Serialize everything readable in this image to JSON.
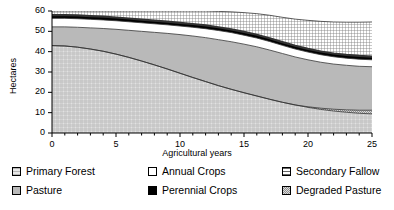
{
  "chart_data": {
    "type": "area",
    "title": "",
    "xlabel": "Agricultural years",
    "ylabel": "Hectares",
    "xlim": [
      0,
      25
    ],
    "ylim": [
      0,
      60
    ],
    "xticks": [
      0,
      5,
      10,
      15,
      20,
      25
    ],
    "yticks": [
      0,
      10,
      20,
      30,
      40,
      50,
      60
    ],
    "grid": false,
    "legend_position": "below",
    "stacked": true,
    "stack_order_bottom_to_top": [
      "Primary Forest",
      "Degraded Pasture",
      "Pasture",
      "Annual Crops",
      "Perennial Crops",
      "Secondary Fallow"
    ],
    "x": [
      0,
      1,
      2,
      3,
      4,
      5,
      6,
      7,
      8,
      9,
      10,
      11,
      12,
      13,
      14,
      15,
      16,
      17,
      18,
      19,
      20,
      21,
      22,
      23,
      24,
      25
    ],
    "series": [
      {
        "name": "Primary Forest",
        "swatch": "light-crosshatch",
        "color": "#d6d6d6",
        "values": [
          43.0,
          42.8,
          42.2,
          41.3,
          40.2,
          38.8,
          37.2,
          35.4,
          33.5,
          31.5,
          29.4,
          27.3,
          25.3,
          23.3,
          21.5,
          19.8,
          18.2,
          16.6,
          15.1,
          13.8,
          12.6,
          11.6,
          10.8,
          10.2,
          9.7,
          9.4
        ]
      },
      {
        "name": "Degraded Pasture",
        "swatch": "dense-dots",
        "color": "#bfbfbf",
        "values": [
          0.0,
          0.0,
          0.0,
          0.0,
          0.0,
          0.0,
          0.0,
          0.0,
          0.0,
          0.0,
          0.0,
          0.0,
          0.0,
          0.0,
          0.0,
          0.0,
          0.0,
          0.0,
          0.0,
          0.0,
          0.3,
          0.6,
          0.9,
          1.2,
          1.5,
          1.8
        ]
      },
      {
        "name": "Pasture",
        "swatch": "solid-gray",
        "color": "#b8b8b8",
        "values": [
          9.2,
          9.4,
          9.8,
          10.4,
          11.2,
          12.2,
          13.3,
          14.6,
          16.0,
          17.5,
          19.0,
          20.4,
          21.6,
          22.6,
          23.4,
          23.9,
          24.2,
          24.2,
          24.0,
          23.6,
          23.1,
          22.6,
          22.2,
          21.9,
          21.6,
          21.4
        ]
      },
      {
        "name": "Annual Crops",
        "swatch": "white",
        "color": "#ffffff",
        "values": [
          4.2,
          4.2,
          4.2,
          4.2,
          4.2,
          4.2,
          4.2,
          4.2,
          4.2,
          4.2,
          4.2,
          4.3,
          4.4,
          4.5,
          4.5,
          4.4,
          4.3,
          4.2,
          4.0,
          3.9,
          3.8,
          3.7,
          3.6,
          3.5,
          3.5,
          3.4
        ]
      },
      {
        "name": "Perennial Crops",
        "swatch": "solid-black",
        "color": "#000000",
        "values": [
          1.6,
          1.6,
          1.6,
          1.6,
          1.6,
          1.6,
          1.6,
          1.6,
          1.6,
          1.6,
          1.6,
          1.6,
          1.6,
          1.6,
          1.6,
          1.6,
          1.6,
          1.6,
          1.6,
          1.6,
          1.6,
          1.6,
          1.6,
          1.6,
          1.6,
          1.6
        ]
      },
      {
        "name": "Secondary Fallow",
        "swatch": "fine-crosshatch",
        "color": "#cccccc",
        "values": [
          2.0,
          2.0,
          2.2,
          2.5,
          2.8,
          3.2,
          3.7,
          4.2,
          4.7,
          5.2,
          5.8,
          6.4,
          7.1,
          7.8,
          8.6,
          9.5,
          10.4,
          11.3,
          12.2,
          13.1,
          14.0,
          14.8,
          15.5,
          16.1,
          16.6,
          17.0
        ]
      }
    ],
    "totals": [
      60.0,
      60.0,
      60.0,
      59.9,
      59.8,
      59.8,
      59.8,
      59.8,
      59.8,
      59.8,
      59.8,
      59.8,
      59.8,
      59.6,
      59.4,
      59.1,
      58.6,
      57.9,
      57.1,
      56.2,
      55.4,
      54.7,
      54.2,
      53.7,
      53.3,
      52.9
    ]
  },
  "legend": {
    "items": [
      {
        "label": "Primary Forest",
        "swatch": "light-crosshatch"
      },
      {
        "label": "Pasture",
        "swatch": "solid-gray"
      },
      {
        "label": "Annual Crops",
        "swatch": "white"
      },
      {
        "label": "Perennial Crops",
        "swatch": "solid-black"
      },
      {
        "label": "Secondary Fallow",
        "swatch": "fine-crosshatch"
      },
      {
        "label": "Degraded Pasture",
        "swatch": "dense-dots"
      }
    ]
  },
  "ticks": {
    "y": [
      "60",
      "50",
      "40",
      "30",
      "20",
      "10",
      "0"
    ],
    "x": [
      "0",
      "5",
      "10",
      "15",
      "20",
      "25"
    ]
  }
}
